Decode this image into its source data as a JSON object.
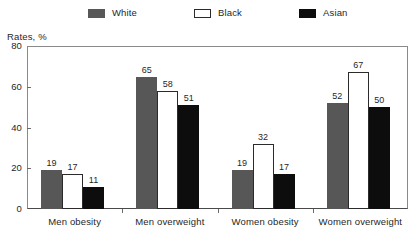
{
  "axis_title": "Rates, %",
  "legend": {
    "items": [
      {
        "label": "White",
        "swatch": "filled-gray-swatch-icon",
        "color": "#575757"
      },
      {
        "label": "Black",
        "swatch": "outlined-white-swatch-icon",
        "color": "#ffffff"
      },
      {
        "label": "Asian",
        "swatch": "filled-black-swatch-icon",
        "color": "#0d0d0d"
      }
    ]
  },
  "yaxis": {
    "ticks": [
      "0",
      "20",
      "40",
      "60",
      "80"
    ]
  },
  "chart_data": {
    "type": "bar",
    "title": "",
    "subtitle": "",
    "xlabel": "",
    "ylabel": "Rates, %",
    "ylim": [
      0,
      80
    ],
    "yticks": [
      0,
      20,
      40,
      60,
      80
    ],
    "grid": false,
    "legend_position": "top-center",
    "categories": [
      "Men obesity",
      "Men overweight",
      "Women obesity",
      "Women overweight"
    ],
    "series": [
      {
        "name": "White",
        "color": "#575757",
        "values": [
          19,
          65,
          19,
          52
        ]
      },
      {
        "name": "Black",
        "color": "#ffffff",
        "values": [
          17,
          58,
          32,
          67
        ]
      },
      {
        "name": "Asian",
        "color": "#0d0d0d",
        "values": [
          11,
          51,
          17,
          50
        ]
      }
    ],
    "data_labels": [
      [
        "19",
        "17",
        "11"
      ],
      [
        "65",
        "58",
        "51"
      ],
      [
        "19",
        "32",
        "17"
      ],
      [
        "52",
        "67",
        "50"
      ]
    ]
  }
}
